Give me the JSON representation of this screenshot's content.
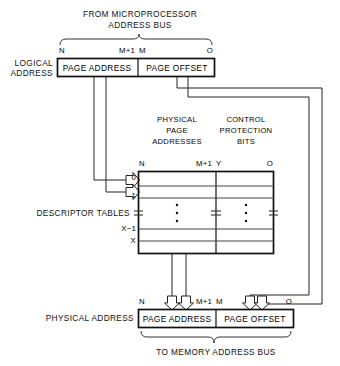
{
  "diagram": {
    "title_top_line1": "FROM MICROPROCESSOR",
    "title_top_line2": "ADDRESS BUS",
    "title_bottom": "TO MEMORY ADDRESS BUS"
  },
  "logical_address": {
    "label_line1": "LOGICAL",
    "label_line2": "ADDRESS",
    "field_page_address": "PAGE ADDRESS",
    "field_page_offset": "PAGE OFFSET",
    "bit_left": "N",
    "bit_mid_high": "M+1",
    "bit_mid_low": "M",
    "bit_right": "O"
  },
  "table": {
    "header_left_line1": "PHYSICAL",
    "header_left_line2": "PAGE",
    "header_left_line3": "ADDRESSES",
    "header_right_line1": "CONTROL",
    "header_right_line2": "PROTECTION",
    "header_right_line3": "BITS",
    "bit_left": "N",
    "bit_mid_high": "M+1",
    "bit_mid_low": "Y",
    "bit_right": "O",
    "side_label": "DESCRIPTOR TABLES",
    "row_indices": [
      "0",
      "1",
      "X−1",
      "X"
    ],
    "ellipsis_symbol": "⋮",
    "break_symbol": "≈"
  },
  "physical_address": {
    "label": "PHYSICAL ADDRESS",
    "field_page_address": "PAGE ADDRESS",
    "field_page_offset": "PAGE OFFSET",
    "bit_left": "N",
    "bit_mid_high": "M+1",
    "bit_mid_low": "M",
    "bit_right": "O"
  },
  "colors": {
    "ink": "#111111",
    "wire": "#222222",
    "rule": "#444444",
    "background": "#ffffff"
  }
}
